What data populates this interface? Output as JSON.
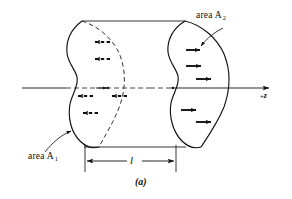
{
  "figure": {
    "caption": "(a)",
    "labels": {
      "area1_text": "area A",
      "area1_sub": "1",
      "area2_text": "area A",
      "area2_sub": "2",
      "axis_plus": "+",
      "axis_name": "z",
      "length": "l"
    },
    "colors": {
      "ink": "#111111",
      "paper": "#ffffff",
      "dashed": "#333333"
    },
    "elements": {
      "blob_left_name": "area A 1 cross-section",
      "blob_right_name": "area A 2 cross-section",
      "axis_name": "+z axis",
      "dimension_name": "length l between A1 and A2",
      "arrows_left_count": "5",
      "arrows_right_count": "5",
      "arrow_left_style": "dashed leftward",
      "arrow_right_style": "solid rightward"
    }
  }
}
